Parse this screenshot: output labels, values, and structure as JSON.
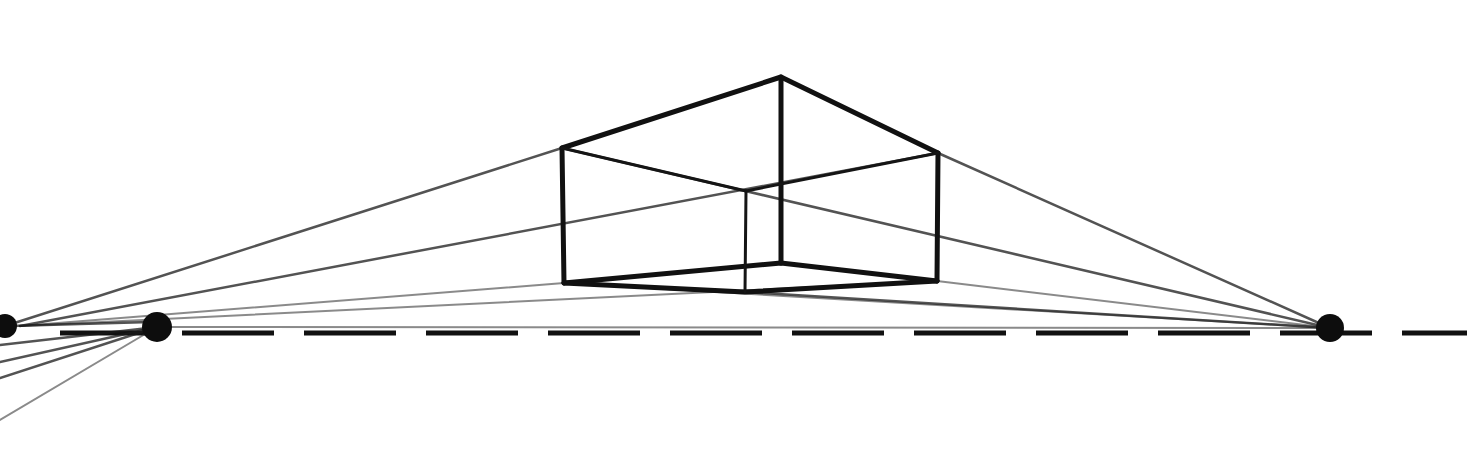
{
  "drawing": {
    "subject": "two-point perspective box",
    "colors": {
      "paper": "#ffffff",
      "graphite": "#111111"
    },
    "horizon_line": {
      "y": 333,
      "x_start": 60,
      "x_end": 1467,
      "style": "dashed"
    },
    "vanishing_points": [
      {
        "name": "left-vp-edge",
        "x": 5,
        "y": 326,
        "r": 12
      },
      {
        "name": "left-vp",
        "x": 157,
        "y": 327,
        "r": 15
      },
      {
        "name": "right-vp",
        "x": 1330,
        "y": 328,
        "r": 14
      }
    ],
    "box_vertices": {
      "front_top": [
        781,
        77
      ],
      "left_top": [
        562,
        148
      ],
      "right_top": [
        938,
        153
      ],
      "back_top": [
        746,
        191
      ],
      "front_bottom": [
        781,
        263
      ],
      "left_bottom": [
        564,
        283
      ],
      "right_bottom": [
        937,
        281
      ],
      "back_bottom": [
        745,
        292
      ]
    }
  }
}
